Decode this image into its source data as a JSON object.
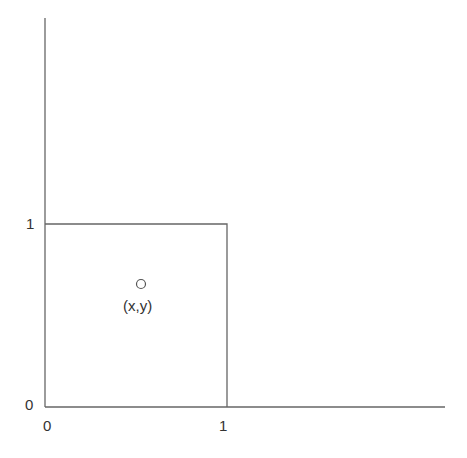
{
  "diagram": {
    "x_axis": {
      "ticks": [
        {
          "label": "0"
        },
        {
          "label": "1"
        }
      ]
    },
    "y_axis": {
      "ticks": [
        {
          "label": "0"
        },
        {
          "label": "1"
        }
      ]
    },
    "unit_square": {
      "x": [
        0,
        1
      ],
      "y": [
        0,
        1
      ]
    },
    "point": {
      "label": "(x,y)",
      "marker": "open-circle"
    },
    "colors": {
      "line": "#555555",
      "text": "#333333",
      "background": "#ffffff"
    }
  }
}
